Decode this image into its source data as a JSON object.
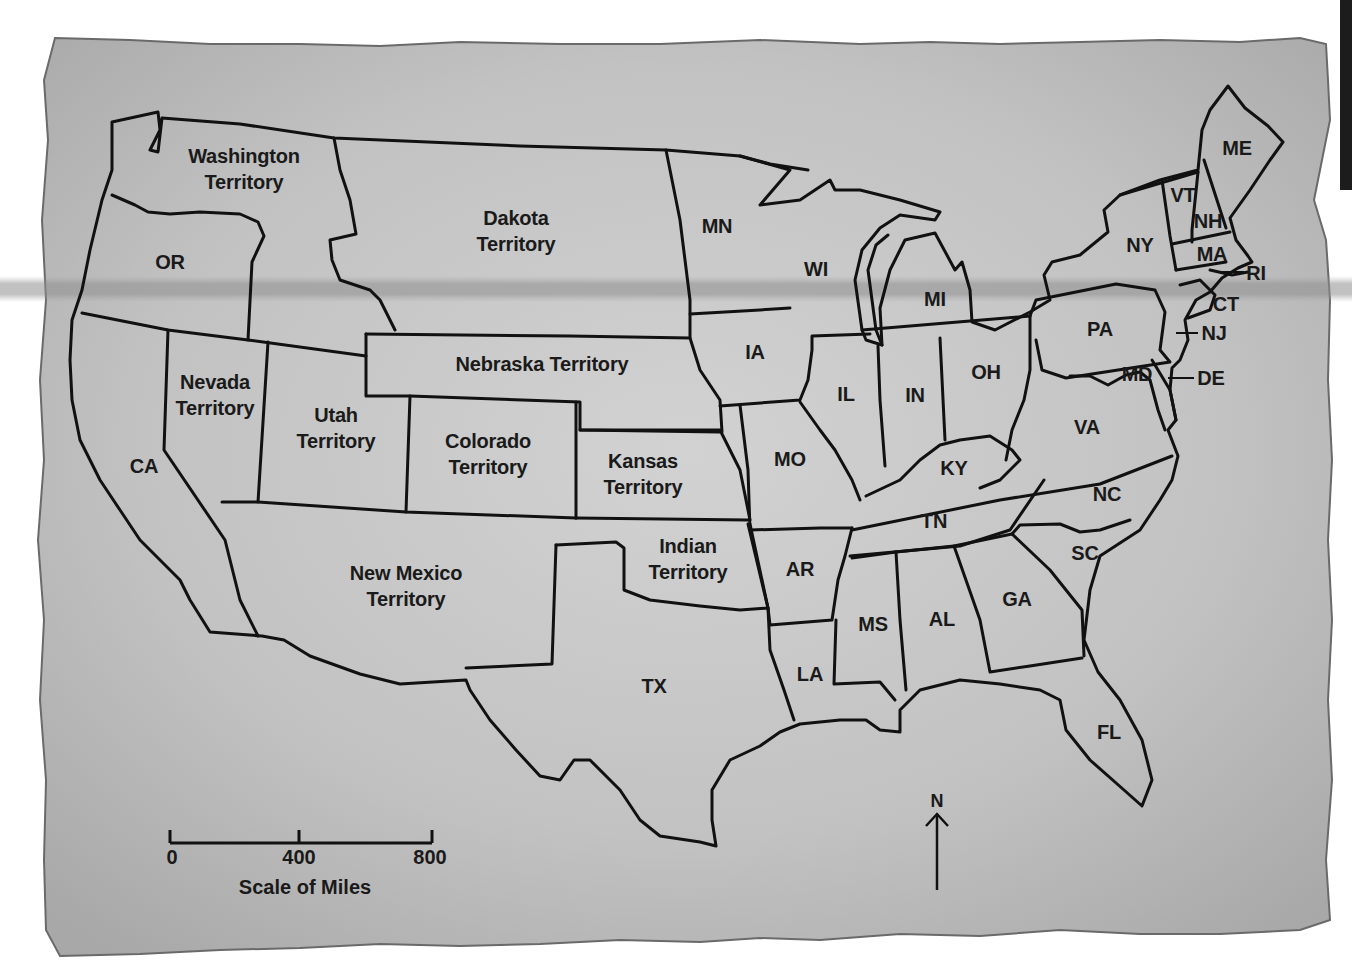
{
  "map": {
    "title": "United States territories map",
    "paper_color": "#c4c4c4",
    "line_color": "#111111",
    "regions": [
      {
        "id": "washington",
        "label": "Washington\nTerritory",
        "x": 244,
        "y": 169
      },
      {
        "id": "oregon",
        "label": "OR",
        "x": 170,
        "y": 262
      },
      {
        "id": "california",
        "label": "CA",
        "x": 144,
        "y": 466
      },
      {
        "id": "nevada",
        "label": "Nevada\nTerritory",
        "x": 215,
        "y": 395
      },
      {
        "id": "utah",
        "label": "Utah\nTerritory",
        "x": 336,
        "y": 428
      },
      {
        "id": "dakota",
        "label": "Dakota\nTerritory",
        "x": 516,
        "y": 231
      },
      {
        "id": "nebraska",
        "label": "Nebraska Territory",
        "x": 542,
        "y": 364
      },
      {
        "id": "colorado",
        "label": "Colorado\nTerritory",
        "x": 488,
        "y": 454
      },
      {
        "id": "kansas",
        "label": "Kansas\nTerritory",
        "x": 643,
        "y": 474
      },
      {
        "id": "new_mexico",
        "label": "New Mexico\nTerritory",
        "x": 406,
        "y": 586
      },
      {
        "id": "indian",
        "label": "Indian\nTerritory",
        "x": 688,
        "y": 559
      },
      {
        "id": "texas",
        "label": "TX",
        "x": 654,
        "y": 686
      },
      {
        "id": "minnesota",
        "label": "MN",
        "x": 717,
        "y": 226
      },
      {
        "id": "wisconsin",
        "label": "WI",
        "x": 816,
        "y": 269
      },
      {
        "id": "michigan",
        "label": "MI",
        "x": 935,
        "y": 299
      },
      {
        "id": "iowa",
        "label": "IA",
        "x": 755,
        "y": 352
      },
      {
        "id": "illinois",
        "label": "IL",
        "x": 846,
        "y": 394
      },
      {
        "id": "indiana",
        "label": "IN",
        "x": 915,
        "y": 395
      },
      {
        "id": "ohio",
        "label": "OH",
        "x": 986,
        "y": 372
      },
      {
        "id": "missouri",
        "label": "MO",
        "x": 790,
        "y": 459
      },
      {
        "id": "kentucky",
        "label": "KY",
        "x": 954,
        "y": 468
      },
      {
        "id": "tennessee",
        "label": "TN",
        "x": 934,
        "y": 521
      },
      {
        "id": "arkansas",
        "label": "AR",
        "x": 800,
        "y": 569
      },
      {
        "id": "louisiana",
        "label": "LA",
        "x": 810,
        "y": 674
      },
      {
        "id": "mississippi",
        "label": "MS",
        "x": 873,
        "y": 624
      },
      {
        "id": "alabama",
        "label": "AL",
        "x": 942,
        "y": 619
      },
      {
        "id": "georgia",
        "label": "GA",
        "x": 1017,
        "y": 599
      },
      {
        "id": "florida",
        "label": "FL",
        "x": 1109,
        "y": 732
      },
      {
        "id": "south_carolina",
        "label": "SC",
        "x": 1085,
        "y": 553
      },
      {
        "id": "north_carolina",
        "label": "NC",
        "x": 1107,
        "y": 494
      },
      {
        "id": "virginia",
        "label": "VA",
        "x": 1087,
        "y": 427
      },
      {
        "id": "pennsylvania",
        "label": "PA",
        "x": 1100,
        "y": 329
      },
      {
        "id": "new_york",
        "label": "NY",
        "x": 1140,
        "y": 245
      },
      {
        "id": "maine",
        "label": "ME",
        "x": 1237,
        "y": 148
      },
      {
        "id": "vermont",
        "label": "VT",
        "x": 1183,
        "y": 195
      },
      {
        "id": "new_hampshire",
        "label": "NH",
        "x": 1208,
        "y": 221
      },
      {
        "id": "massachusetts",
        "label": "MA",
        "x": 1212,
        "y": 254
      },
      {
        "id": "rhode_island",
        "label": "RI",
        "x": 1256,
        "y": 273
      },
      {
        "id": "connecticut",
        "label": "CT",
        "x": 1226,
        "y": 304
      },
      {
        "id": "new_jersey",
        "label": "NJ",
        "x": 1214,
        "y": 333
      },
      {
        "id": "maryland",
        "label": "MD",
        "x": 1137,
        "y": 374
      },
      {
        "id": "delaware",
        "label": "DE",
        "x": 1211,
        "y": 378
      }
    ]
  },
  "scale_bar": {
    "ticks": [
      "0",
      "400",
      "800"
    ],
    "caption": "Scale of Miles",
    "units": "miles"
  },
  "compass": {
    "label": "N"
  }
}
